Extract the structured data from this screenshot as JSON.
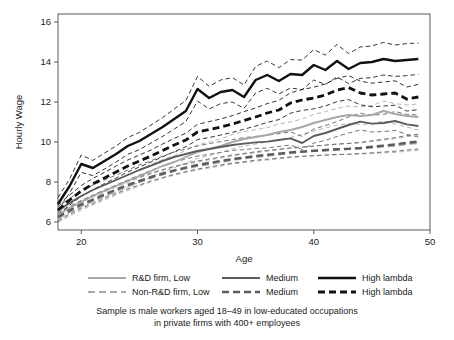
{
  "chart_data": {
    "type": "line",
    "title": "",
    "xlabel": "Age",
    "ylabel": "Hourly Wage",
    "xlim": [
      18,
      50
    ],
    "ylim": [
      5.6,
      16.4
    ],
    "xticks": [
      20,
      30,
      40,
      50
    ],
    "yticks": [
      6,
      8,
      10,
      12,
      14,
      16
    ],
    "grid": false,
    "legend_position": "below-plot",
    "x": [
      18,
      19,
      20,
      21,
      22,
      23,
      24,
      25,
      26,
      27,
      28,
      29,
      30,
      31,
      32,
      33,
      34,
      35,
      36,
      37,
      38,
      39,
      40,
      41,
      42,
      43,
      44,
      45,
      46,
      47,
      48,
      49
    ],
    "series": [
      {
        "name": "R&D firm, Low",
        "key": "rd_low",
        "style": "solid",
        "color": "#a8a8a8",
        "width": 1.9,
        "values": [
          6.35,
          6.7,
          7.0,
          7.3,
          7.55,
          7.8,
          8.05,
          8.3,
          8.55,
          8.8,
          9.0,
          9.25,
          9.5,
          9.65,
          9.8,
          10.0,
          10.15,
          10.25,
          10.35,
          10.5,
          10.6,
          10.75,
          10.95,
          11.1,
          11.25,
          11.35,
          11.3,
          11.35,
          11.55,
          11.4,
          11.3,
          11.25
        ],
        "ci_lower": [
          6.1,
          6.45,
          6.72,
          7.0,
          7.25,
          7.5,
          7.75,
          8.0,
          8.25,
          8.5,
          8.72,
          8.95,
          9.18,
          9.32,
          9.48,
          9.65,
          9.8,
          9.9,
          10.0,
          10.12,
          10.22,
          10.38,
          10.55,
          10.7,
          10.85,
          10.92,
          10.88,
          10.9,
          11.05,
          10.9,
          10.75,
          10.6
        ],
        "ci_upper": [
          6.62,
          6.98,
          7.3,
          7.6,
          7.88,
          8.12,
          8.38,
          8.62,
          8.88,
          9.12,
          9.32,
          9.58,
          9.85,
          10.0,
          10.15,
          10.38,
          10.52,
          10.62,
          10.72,
          10.9,
          11.0,
          11.15,
          11.38,
          11.52,
          11.68,
          11.8,
          11.75,
          11.82,
          12.05,
          11.92,
          11.85,
          11.9
        ]
      },
      {
        "name": "R&D firm, Medium",
        "key": "rd_medium",
        "style": "solid",
        "color": "#5c5c5c",
        "width": 1.9,
        "values": [
          6.55,
          6.95,
          7.3,
          7.6,
          7.85,
          8.1,
          8.35,
          8.6,
          8.82,
          9.05,
          9.25,
          9.4,
          9.55,
          9.65,
          9.75,
          9.85,
          9.92,
          9.98,
          10.02,
          10.1,
          10.18,
          9.95,
          10.3,
          10.45,
          10.65,
          10.85,
          11.02,
          10.92,
          10.95,
          11.05,
          10.88,
          10.8
        ],
        "ci_lower": [
          6.32,
          6.72,
          7.05,
          7.35,
          7.6,
          7.85,
          8.1,
          8.35,
          8.58,
          8.8,
          9.0,
          9.15,
          9.3,
          9.38,
          9.48,
          9.58,
          9.62,
          9.68,
          9.7,
          9.78,
          9.85,
          9.62,
          9.95,
          10.08,
          10.28,
          10.45,
          10.6,
          10.5,
          10.52,
          10.58,
          10.38,
          10.25
        ],
        "ci_upper": [
          6.78,
          7.18,
          7.55,
          7.85,
          8.1,
          8.35,
          8.6,
          8.85,
          9.06,
          9.3,
          9.5,
          9.65,
          9.8,
          9.92,
          10.02,
          10.12,
          10.22,
          10.28,
          10.34,
          10.42,
          10.51,
          10.28,
          10.65,
          10.82,
          11.02,
          11.25,
          11.44,
          11.34,
          11.38,
          11.52,
          11.38,
          11.35
        ]
      },
      {
        "name": "R&D firm, High lambda",
        "key": "rd_high",
        "style": "solid",
        "color": "#111111",
        "width": 2.4,
        "values": [
          6.9,
          7.8,
          8.9,
          8.7,
          9.05,
          9.4,
          9.8,
          10.05,
          10.4,
          10.75,
          11.15,
          11.55,
          12.65,
          12.2,
          12.5,
          12.6,
          12.25,
          13.1,
          13.35,
          13.05,
          13.4,
          13.35,
          13.85,
          13.6,
          14.05,
          13.65,
          13.95,
          14.0,
          14.15,
          14.05,
          14.1,
          14.15
        ],
        "ci_lower": [
          6.58,
          7.45,
          8.48,
          8.32,
          8.65,
          9.0,
          9.38,
          9.62,
          9.95,
          10.28,
          10.65,
          11.02,
          12.05,
          11.65,
          11.92,
          12.0,
          11.68,
          12.45,
          12.68,
          12.4,
          12.7,
          12.62,
          13.1,
          12.88,
          13.25,
          12.92,
          13.18,
          13.22,
          13.35,
          13.28,
          13.32,
          13.38
        ],
        "ci_upper": [
          7.22,
          8.15,
          9.35,
          9.08,
          9.45,
          9.8,
          10.22,
          10.48,
          10.85,
          11.22,
          11.65,
          12.08,
          13.28,
          12.78,
          13.1,
          13.22,
          12.85,
          13.78,
          14.05,
          13.72,
          14.12,
          14.1,
          14.62,
          14.35,
          14.88,
          14.42,
          14.75,
          14.8,
          14.98,
          14.85,
          14.92,
          14.95
        ]
      },
      {
        "name": "Non-R&D firm, Low",
        "key": "nonrd_low",
        "style": "dashed",
        "color": "#a8a8a8",
        "width": 2.2,
        "values": [
          6.18,
          6.5,
          6.8,
          7.05,
          7.3,
          7.55,
          7.78,
          8.0,
          8.2,
          8.38,
          8.55,
          8.68,
          8.8,
          8.9,
          9.0,
          9.1,
          9.18,
          9.25,
          9.32,
          9.38,
          9.45,
          9.5,
          9.55,
          9.58,
          9.62,
          9.65,
          9.68,
          9.72,
          9.78,
          9.82,
          9.9,
          9.95
        ],
        "ci_lower": [
          5.98,
          6.3,
          6.6,
          6.86,
          7.1,
          7.35,
          7.58,
          7.8,
          8.0,
          8.18,
          8.35,
          8.48,
          8.6,
          8.7,
          8.8,
          8.9,
          8.97,
          9.04,
          9.1,
          9.16,
          9.22,
          9.27,
          9.31,
          9.33,
          9.36,
          9.38,
          9.4,
          9.42,
          9.46,
          9.48,
          9.54,
          9.58
        ],
        "ci_upper": [
          6.38,
          6.7,
          7.0,
          7.24,
          7.5,
          7.75,
          7.98,
          8.2,
          8.4,
          8.58,
          8.75,
          8.88,
          9.0,
          9.1,
          9.2,
          9.3,
          9.39,
          9.46,
          9.54,
          9.6,
          9.68,
          9.73,
          9.79,
          9.83,
          9.88,
          9.92,
          9.96,
          10.02,
          10.1,
          10.16,
          10.26,
          10.32
        ]
      },
      {
        "name": "Non-R&D firm, Medium",
        "key": "nonrd_medium",
        "style": "dashed",
        "color": "#5c5c5c",
        "width": 2.4,
        "values": [
          6.25,
          6.58,
          6.88,
          7.12,
          7.38,
          7.62,
          7.85,
          8.05,
          8.25,
          8.42,
          8.58,
          8.72,
          8.85,
          8.95,
          9.05,
          9.15,
          9.22,
          9.3,
          9.36,
          9.42,
          9.48,
          9.52,
          9.56,
          9.6,
          9.64,
          9.66,
          9.7,
          9.76,
          9.82,
          9.88,
          9.96,
          10.02
        ],
        "ci_lower": [
          6.05,
          6.38,
          6.68,
          6.92,
          7.18,
          7.42,
          7.65,
          7.85,
          8.05,
          8.22,
          8.38,
          8.52,
          8.65,
          8.75,
          8.85,
          8.95,
          9.01,
          9.09,
          9.14,
          9.2,
          9.25,
          9.29,
          9.32,
          9.35,
          9.38,
          9.39,
          9.42,
          9.46,
          9.5,
          9.54,
          9.6,
          9.65
        ],
        "ci_upper": [
          6.45,
          6.78,
          7.08,
          7.32,
          7.58,
          7.82,
          8.05,
          8.25,
          8.45,
          8.62,
          8.78,
          8.92,
          9.05,
          9.15,
          9.25,
          9.35,
          9.43,
          9.51,
          9.58,
          9.64,
          9.71,
          9.75,
          9.8,
          9.85,
          9.9,
          9.93,
          9.98,
          10.06,
          10.14,
          10.22,
          10.32,
          10.39
        ]
      },
      {
        "name": "Non-R&D firm, High lambda",
        "key": "nonrd_high",
        "style": "dashed",
        "color": "#111111",
        "width": 2.8,
        "values": [
          6.6,
          7.1,
          7.55,
          7.9,
          8.2,
          8.5,
          8.8,
          9.05,
          9.3,
          9.58,
          9.85,
          10.1,
          10.5,
          10.62,
          10.75,
          10.9,
          11.08,
          11.25,
          11.45,
          11.6,
          11.95,
          12.1,
          12.2,
          12.35,
          12.6,
          12.72,
          12.45,
          12.35,
          12.4,
          12.45,
          12.15,
          12.25
        ],
        "ci_lower": [
          6.35,
          6.85,
          7.28,
          7.62,
          7.92,
          8.2,
          8.5,
          8.75,
          9.0,
          9.26,
          9.52,
          9.76,
          10.12,
          10.22,
          10.35,
          10.48,
          10.64,
          10.8,
          10.98,
          11.12,
          11.44,
          11.58,
          11.66,
          11.8,
          12.02,
          12.12,
          11.86,
          11.76,
          11.8,
          11.84,
          11.55,
          11.62
        ],
        "ci_upper": [
          6.85,
          7.35,
          7.82,
          8.18,
          8.48,
          8.8,
          9.1,
          9.35,
          9.6,
          9.9,
          10.18,
          10.44,
          10.88,
          11.02,
          11.15,
          11.32,
          11.52,
          11.7,
          11.92,
          12.08,
          12.46,
          12.62,
          12.74,
          12.9,
          13.18,
          13.32,
          13.04,
          12.94,
          13.0,
          13.06,
          12.75,
          12.88
        ]
      }
    ]
  },
  "legend": {
    "rows": [
      {
        "style": "solid",
        "items": [
          {
            "label": "R&D firm, Low",
            "color": "#a8a8a8",
            "width": 1.9
          },
          {
            "label": "Medium",
            "color": "#5c5c5c",
            "width": 1.9
          },
          {
            "label": "High lambda",
            "color": "#111111",
            "width": 2.4
          }
        ]
      },
      {
        "style": "dashed",
        "items": [
          {
            "label": "Non-R&D firm, Low",
            "color": "#a8a8a8",
            "width": 2.2
          },
          {
            "label": "Medium",
            "color": "#5c5c5c",
            "width": 2.4
          },
          {
            "label": "High lambda",
            "color": "#111111",
            "width": 2.8
          }
        ]
      }
    ]
  },
  "caption": {
    "line1": "Sample is male workers aged 18–49 in low-educated occupations",
    "line2": "in private firms with 400+ employees"
  },
  "colors": {
    "low": "#a8a8a8",
    "medium": "#5c5c5c",
    "high": "#111111",
    "axis": "#4a4a4a",
    "text": "#1a1a1a",
    "background": "#ffffff"
  }
}
